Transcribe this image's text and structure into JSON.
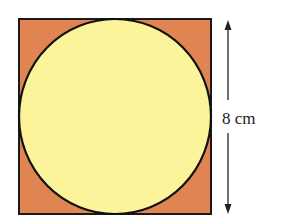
{
  "diagram": {
    "shapes": {
      "square": {
        "fill": "#e08552",
        "stroke": "#1a1a1a"
      },
      "circle": {
        "fill": "#fbf49a",
        "stroke": "#111111"
      }
    },
    "dimension": {
      "label": "8 cm",
      "orientation": "vertical"
    }
  }
}
